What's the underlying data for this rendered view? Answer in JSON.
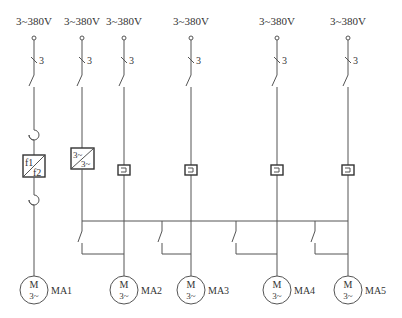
{
  "diagram": {
    "type": "electrical-schematic",
    "supply_labels": [
      "3~380V",
      "3~380V",
      "3~380V",
      "3~380V",
      "3~380V",
      "3~380V"
    ],
    "pole_count_label": "3",
    "frequency_converter": {
      "top": "f1",
      "bottom": "f2"
    },
    "inverter": {
      "top": "3~",
      "bottom": "3~"
    },
    "motors": [
      {
        "id": "MA1",
        "symbol": "M",
        "phase": "3~"
      },
      {
        "id": "MA2",
        "symbol": "M",
        "phase": "3~"
      },
      {
        "id": "MA3",
        "symbol": "M",
        "phase": "3~"
      },
      {
        "id": "MA4",
        "symbol": "M",
        "phase": "3~"
      },
      {
        "id": "MA5",
        "symbol": "M",
        "phase": "3~"
      }
    ],
    "colors": {
      "line": "#555555",
      "text": "#333333",
      "background": "#ffffff"
    }
  }
}
